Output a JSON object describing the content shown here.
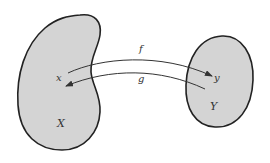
{
  "diagram": {
    "type": "mapping",
    "sets": [
      {
        "id": "X",
        "label": "X",
        "element": "x",
        "fill": "#d4d4d4",
        "stroke": "#222222"
      },
      {
        "id": "Y",
        "label": "Y",
        "element": "y",
        "fill": "#d4d4d4",
        "stroke": "#222222"
      }
    ],
    "arrows": [
      {
        "id": "f",
        "label": "f",
        "from": "x",
        "to": "y"
      },
      {
        "id": "g",
        "label": "g",
        "from": "y",
        "to": "x"
      }
    ]
  },
  "labels": {
    "set_x": "X",
    "set_y": "Y",
    "elem_x": "x",
    "elem_y": "y",
    "arrow_f": "f",
    "arrow_g": "g"
  }
}
